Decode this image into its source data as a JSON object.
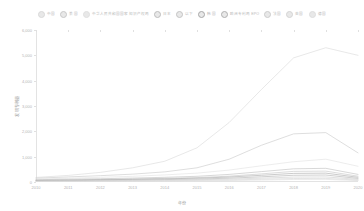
{
  "chart_data": {
    "type": "line",
    "title": "",
    "xlabel": "年份",
    "ylabel": "发明专利量",
    "x": [
      2010,
      2011,
      2012,
      2013,
      2014,
      2015,
      2016,
      2017,
      2018,
      2019,
      2020
    ],
    "xtick_labels": [
      "2010",
      "2011",
      "2012",
      "2013",
      "2014",
      "2015",
      "2016",
      "2017",
      "2018",
      "2019",
      "2020"
    ],
    "ylim": [
      0,
      6000
    ],
    "yticks": [
      0,
      1000,
      2000,
      3000,
      4000,
      5000,
      6000
    ],
    "ytick_labels": [
      "0",
      "1,000",
      "2,000",
      "3,000",
      "4,000",
      "5,000",
      "6,000"
    ],
    "grid": false,
    "legend_position": "top",
    "series": [
      {
        "name": "中国",
        "color": "#d9d9d9",
        "values": [
          180,
          260,
          380,
          560,
          820,
          1350,
          2350,
          3650,
          4900,
          5300,
          5000
        ]
      },
      {
        "name": "美国",
        "color": "#c8c8c8",
        "values": [
          150,
          200,
          250,
          310,
          400,
          560,
          900,
          1450,
          1900,
          1950,
          1150
        ]
      },
      {
        "name": "中华人民共和国国家知识产权局",
        "color": "#e0e0e0",
        "values": [
          120,
          150,
          185,
          225,
          280,
          350,
          470,
          640,
          800,
          900,
          620
        ]
      },
      {
        "name": "日本",
        "color": "#bdbdbd",
        "values": [
          90,
          110,
          130,
          155,
          185,
          225,
          300,
          410,
          520,
          540,
          300
        ]
      },
      {
        "name": "以下",
        "color": "#c4c4c4",
        "values": [
          70,
          85,
          100,
          120,
          145,
          175,
          230,
          320,
          420,
          430,
          230
        ]
      },
      {
        "name": "韩国",
        "color": "#a8a8a8",
        "values": [
          60,
          72,
          88,
          105,
          125,
          150,
          195,
          265,
          340,
          350,
          185
        ]
      },
      {
        "name": "欧洲专利局 EPO",
        "color": "#b0b0b0",
        "values": [
          45,
          55,
          66,
          80,
          95,
          115,
          150,
          205,
          265,
          275,
          140
        ]
      },
      {
        "name": "法国",
        "color": "#cccccc",
        "values": [
          35,
          42,
          50,
          60,
          72,
          88,
          113,
          152,
          195,
          200,
          105
        ]
      },
      {
        "name": "英国",
        "color": "#d4d4d4",
        "values": [
          25,
          30,
          36,
          43,
          52,
          63,
          80,
          108,
          138,
          142,
          75
        ]
      },
      {
        "name": "德国",
        "color": "#dedede",
        "values": [
          18,
          22,
          26,
          31,
          38,
          46,
          58,
          78,
          100,
          103,
          55
        ]
      }
    ]
  }
}
